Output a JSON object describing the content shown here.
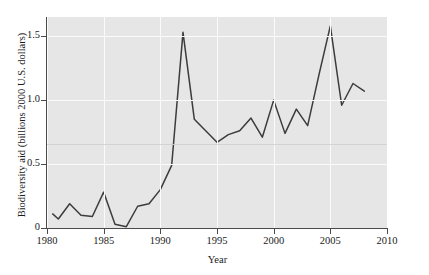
{
  "chart_data": {
    "type": "line",
    "title": "",
    "xlabel": "Year",
    "ylabel": "Biodiversity aid (billions 2000 U.S. dollars)",
    "xlim": [
      1980,
      2010
    ],
    "ylim": [
      0,
      1.65
    ],
    "xticks": [
      1980,
      1985,
      1990,
      1995,
      2000,
      2005,
      2010
    ],
    "xticklabels": [
      "1980",
      "1985",
      "1990",
      "1995",
      "2000",
      "2005",
      "2010"
    ],
    "yticks": [
      0,
      0.5,
      1.0,
      1.5
    ],
    "yticklabels": [
      "0",
      "0.5",
      "1.0",
      "1.5"
    ],
    "grid": true,
    "legend": "none",
    "line_color": "#3c3c3c",
    "panel_color": "#e6e6e6",
    "gridline_color": "#fbfbfb",
    "x": [
      1980.5,
      1981,
      1982,
      1983,
      1984,
      1985,
      1986,
      1987,
      1988,
      1989,
      1990,
      1991,
      1992,
      1993,
      1994,
      1995,
      1996,
      1997,
      1998,
      1999,
      2000,
      2001,
      2002,
      2003,
      2004,
      2005,
      2006,
      2007,
      2008
    ],
    "values": [
      0.11,
      0.07,
      0.19,
      0.1,
      0.09,
      0.28,
      0.03,
      0.01,
      0.17,
      0.19,
      0.3,
      0.49,
      1.53,
      0.85,
      0.76,
      0.67,
      0.73,
      0.76,
      0.86,
      0.71,
      1.0,
      0.74,
      0.93,
      0.8,
      1.2,
      1.58,
      0.96,
      1.13,
      1.07
    ],
    "series": [
      {
        "name": "Biodiversity aid",
        "values": [
          0.11,
          0.07,
          0.19,
          0.1,
          0.09,
          0.28,
          0.03,
          0.01,
          0.17,
          0.19,
          0.3,
          0.49,
          1.53,
          0.85,
          0.76,
          0.67,
          0.73,
          0.76,
          0.86,
          0.71,
          1.0,
          0.74,
          0.93,
          0.8,
          1.2,
          1.58,
          0.96,
          1.13,
          1.07
        ]
      }
    ]
  },
  "axes": {
    "ytick_labels": [
      "1.5",
      "1.0",
      "0.5",
      "0"
    ],
    "xtick_labels": [
      "1980",
      "1985",
      "1990",
      "1995",
      "2000",
      "2005",
      "2010"
    ],
    "x_title": "Year",
    "y_title": "Biodiversity aid (billions 2000 U.S. dollars)"
  }
}
